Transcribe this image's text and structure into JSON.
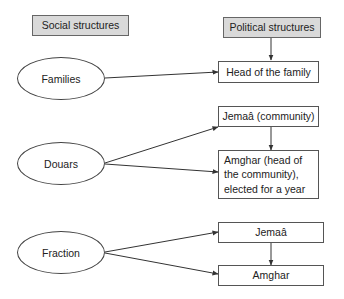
{
  "headers": {
    "social": "Social structures",
    "political": "Political structures"
  },
  "social_nodes": [
    {
      "id": "families",
      "label": "Families"
    },
    {
      "id": "douars",
      "label": "Douars"
    },
    {
      "id": "fraction",
      "label": "Fraction"
    }
  ],
  "political_nodes": [
    {
      "id": "head_family",
      "label": "Head of the family"
    },
    {
      "id": "jemaa_community",
      "label": "Jemaâ (community)"
    },
    {
      "id": "amghar_elected",
      "label": "Amghar (head of the community), elected for a year"
    },
    {
      "id": "jemaa",
      "label": "Jemaâ"
    },
    {
      "id": "amghar",
      "label": "Amghar"
    }
  ],
  "edges": [
    {
      "from": "political_header",
      "to": "head_family"
    },
    {
      "from": "families",
      "to": "head_family"
    },
    {
      "from": "douars",
      "to": "jemaa_community"
    },
    {
      "from": "douars",
      "to": "amghar_elected"
    },
    {
      "from": "jemaa_community",
      "to": "amghar_elected"
    },
    {
      "from": "fraction",
      "to": "jemaa"
    },
    {
      "from": "fraction",
      "to": "amghar"
    },
    {
      "from": "jemaa",
      "to": "amghar"
    }
  ],
  "colors": {
    "header_fill": "#d9d9d9",
    "line": "#333333"
  }
}
